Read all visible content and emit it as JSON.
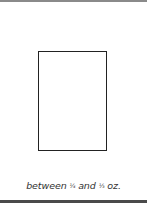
{
  "caption": {
    "prefix": "between ",
    "fraction1": "¼",
    "middle": " and ",
    "fraction2": "⅓",
    "suffix": " oz."
  }
}
